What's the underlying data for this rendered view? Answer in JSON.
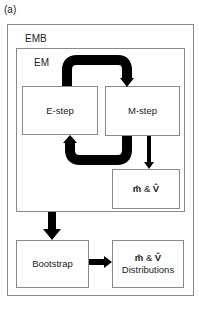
{
  "panel_label": "(a)",
  "frames": {
    "outer": {
      "label": "EMB"
    },
    "inner": {
      "label": "EM"
    }
  },
  "nodes": {
    "e_step": {
      "label": "E-step"
    },
    "m_step": {
      "label": "M-step"
    },
    "estimates": {
      "m_symbol": "m̂",
      "amp": "&",
      "v_symbol": "V̂"
    },
    "bootstrap": {
      "label": "Bootstrap"
    },
    "distributions": {
      "m_symbol": "m̂",
      "amp": "&",
      "v_symbol": "V̂",
      "label": "Distributions"
    }
  },
  "edges": [
    {
      "from": "E-step",
      "to": "M-step"
    },
    {
      "from": "M-step",
      "to": "E-step"
    },
    {
      "from": "M-step",
      "to": "m̂ & V̂"
    },
    {
      "from": "EM",
      "to": "Bootstrap"
    },
    {
      "from": "Bootstrap",
      "to": "m̂ & V̂ Distributions"
    }
  ],
  "colors": {
    "border": "#8a8a8a",
    "arrow": "#000000",
    "text": "#222222"
  }
}
